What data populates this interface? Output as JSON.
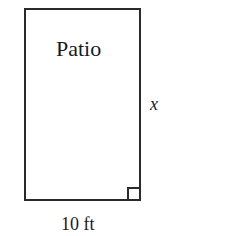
{
  "diagram": {
    "shape": "rectangle",
    "label": "Patio",
    "side_label": "x",
    "bottom_label": "10 ft",
    "right_angle_marker": true,
    "colors": {
      "stroke": "#2a2a2a",
      "background": "#ffffff"
    }
  }
}
